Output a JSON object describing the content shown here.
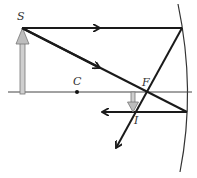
{
  "diagram": {
    "title": "",
    "labels": {
      "source": "S",
      "center": "C",
      "focus": "F",
      "image": "I"
    },
    "colors": {
      "ray": "#1a1a1a",
      "axis": "#444444",
      "mirror": "#333333",
      "object_arrow": "#9a9a9a",
      "image_arrow": "#9a9a9a"
    }
  }
}
